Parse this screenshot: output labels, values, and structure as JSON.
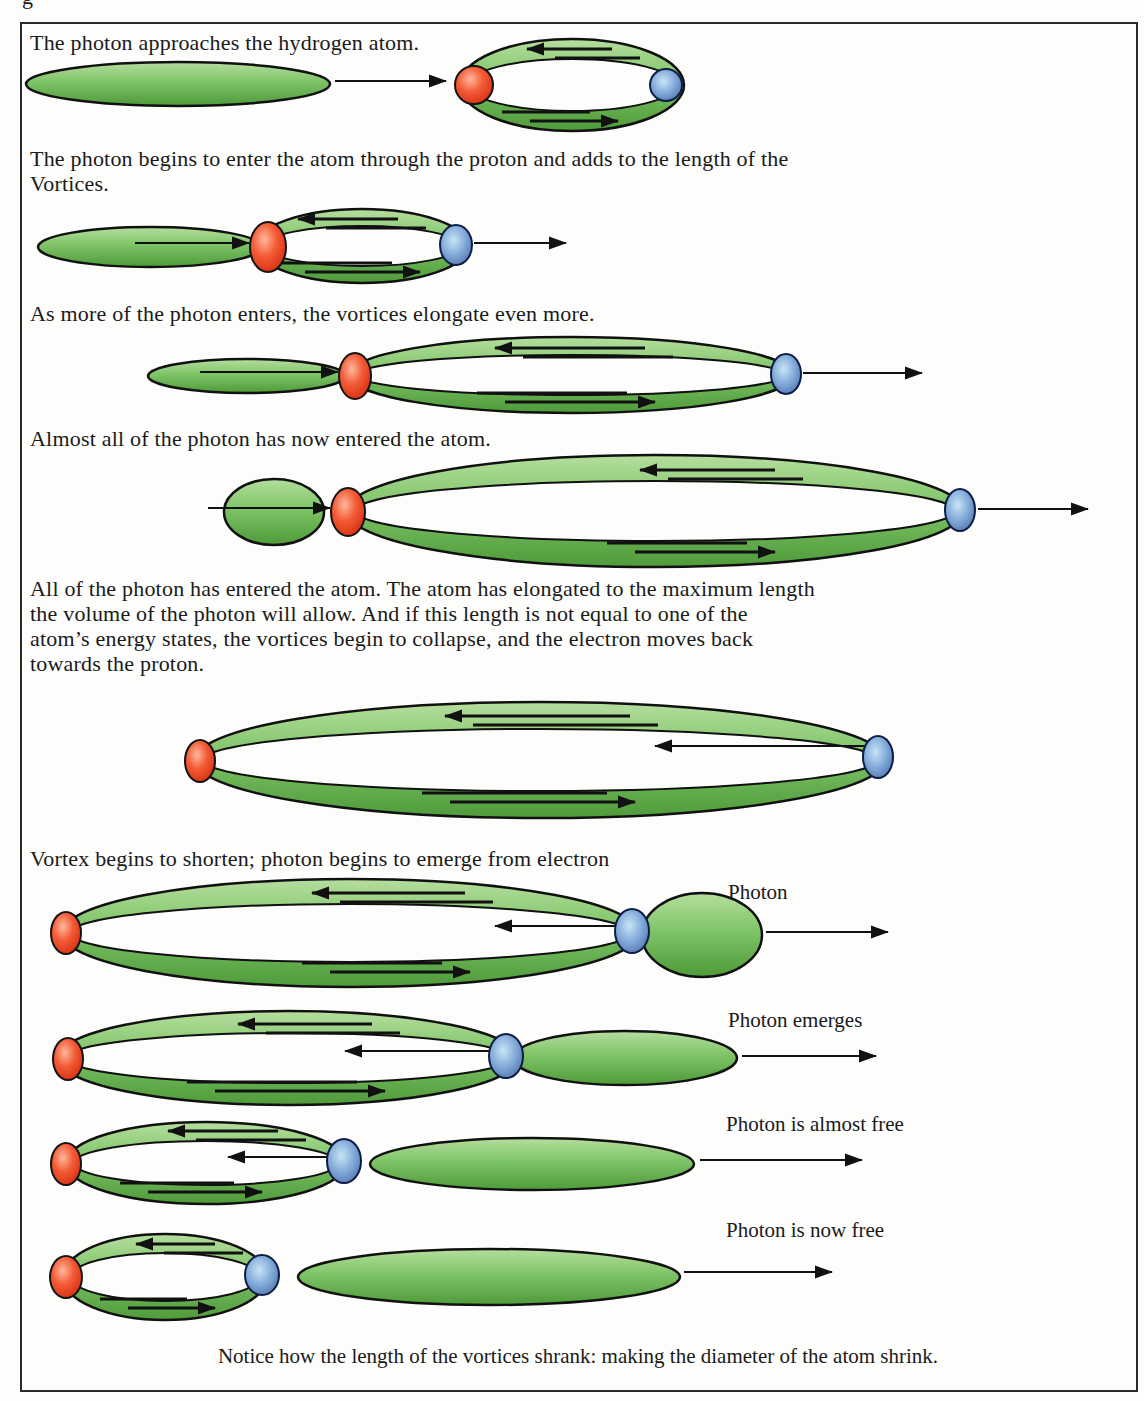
{
  "figure": {
    "top_fragment": "g",
    "steps": [
      "The photon approaches the hydrogen atom.",
      "The photon begins to enter the atom through the proton and adds to the length of the\nVortices.",
      "As more of the photon enters, the vortices elongate even more.",
      "Almost all of the photon has now entered the atom.",
      "All of the photon has entered the atom. The atom has elongated to the maximum length\nthe volume of the photon will allow. And if this length is not equal to one of the\natom’s energy states, the vortices begin to collapse, and the electron moves back\ntowards the proton.",
      "Vortex begins to shorten; photon begins to emerge from electron"
    ],
    "stage_labels": [
      "Photon",
      "Photon emerges",
      "Photon is almost free",
      "Photon is now free"
    ],
    "caption": "Notice how the length of the vortices shrank: making the diameter of the atom shrink.",
    "elements": {
      "proton": "proton-red-sphere",
      "electron": "electron-blue-sphere",
      "vortex": "vortex-green-band",
      "photon": "photon-green-ellipse"
    },
    "colors": {
      "vortex_green": "#6fbd58",
      "proton_red": "#e8381c",
      "electron_blue": "#6b8fc3",
      "outline": "#111111",
      "background": "#fdfdfc"
    }
  }
}
